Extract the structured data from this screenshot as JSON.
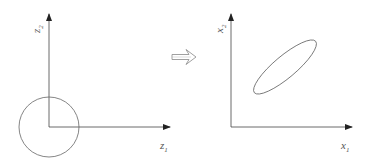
{
  "left_plot": {
    "x_label": "z",
    "x_label_sub": "1",
    "y_label": "z",
    "y_label_sub": "2",
    "shape": "circle",
    "shape_description": "unit circle centered at origin"
  },
  "transform_arrow": {
    "icon": "hollow-double-arrow-right",
    "meaning": "maps to"
  },
  "right_plot": {
    "x_label": "x",
    "x_label_sub": "1",
    "y_label": "x",
    "y_label_sub": "2",
    "shape": "ellipse",
    "shape_description": "tilted ellipse (positive correlation)"
  },
  "colors": {
    "axis": "#333333",
    "shape_stroke": "#666666",
    "arrow_stroke": "#777777",
    "background": "#ffffff"
  }
}
